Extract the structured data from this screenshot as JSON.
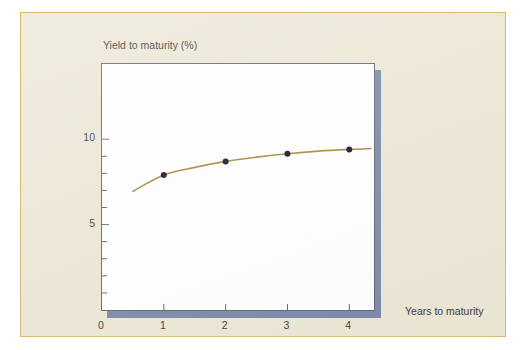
{
  "figure": {
    "background_color": "#ece7d5",
    "border_color": "#d9b878",
    "plot_background": "#ffffff",
    "plot_border_color": "#5d6474",
    "shadow_color": "#7b88a8"
  },
  "chart_data": {
    "type": "line",
    "title": "",
    "subtitle": "",
    "xlabel": "Years to maturity",
    "ylabel": "Yield to maturity (%)",
    "xlim": [
      0,
      4.4
    ],
    "ylim": [
      0,
      14.4
    ],
    "grid": false,
    "legend": null,
    "x_ticks": [
      0,
      1,
      2,
      3,
      4
    ],
    "x_tick_labels": [
      "0",
      "1",
      "2",
      "3",
      "4"
    ],
    "y_ticks": [
      10,
      5
    ],
    "y_tick_labels": [
      "10",
      "5"
    ],
    "y_minor_ticks": [
      10,
      9,
      8,
      7,
      6,
      5,
      4,
      3,
      2,
      1
    ],
    "series": [
      {
        "name": "Yield curve",
        "type": "line",
        "color": "#a8893c",
        "line_width": 1.6,
        "x": [
          0.5,
          1.0,
          1.5,
          2.0,
          2.5,
          3.0,
          3.5,
          4.0,
          4.35
        ],
        "y": [
          6.95,
          7.9,
          8.35,
          8.7,
          8.95,
          9.15,
          9.3,
          9.4,
          9.45
        ]
      },
      {
        "name": "Observed yields",
        "type": "scatter",
        "color": "#121226",
        "marker": "circle",
        "marker_size": 6,
        "x": [
          1,
          2,
          3,
          4
        ],
        "y": [
          7.9,
          8.7,
          9.15,
          9.4
        ]
      }
    ]
  },
  "annotations": {
    "y_axis_title": "Yield to maturity (%)",
    "x_axis_title": "Years to maturity"
  }
}
